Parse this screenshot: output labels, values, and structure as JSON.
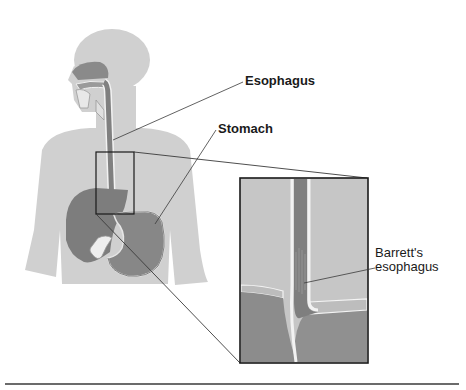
{
  "diagram": {
    "type": "anatomical-illustration",
    "labels": {
      "esophagus": "Esophagus",
      "stomach": "Stomach",
      "barretts_line1": "Barrett's",
      "barretts_line2": "esophagus"
    },
    "colors": {
      "body_silhouette": "#cfcfcf",
      "organ_dark": "#7a7a7a",
      "organ_mid": "#8e8e8e",
      "inset_background": "#c4c4c4",
      "inset_tissue": "#8a8a8a",
      "leader_line": "#3a3a3a",
      "box_border": "#1a1a1a",
      "rule": "#6b6b6b"
    }
  }
}
